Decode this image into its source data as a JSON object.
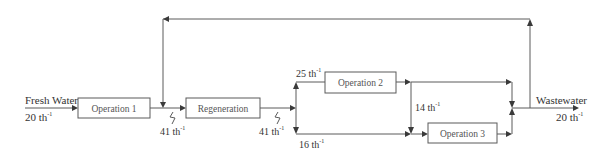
{
  "diagram": {
    "type": "water-network-flowsheet",
    "units": {
      "op1": {
        "label": "Operation 1"
      },
      "regen": {
        "label": "Regeneration"
      },
      "op2": {
        "label": "Operation 2"
      },
      "op3": {
        "label": "Operation 3"
      }
    },
    "streams": {
      "fresh_water": {
        "label": "Fresh Water",
        "flow": "20 th",
        "sup": "-1"
      },
      "op1_out": {
        "flow": "41 th",
        "sup": "-1"
      },
      "regen_out": {
        "flow": "41 th",
        "sup": "-1"
      },
      "to_op2": {
        "flow": "25 th",
        "sup": "-1"
      },
      "to_op3_direct": {
        "flow": "16 th",
        "sup": "-1"
      },
      "op2_to_op3": {
        "flow": "14 th",
        "sup": "-1"
      },
      "wastewater": {
        "label": "Wastewater",
        "flow": "20 th",
        "sup": "-1"
      }
    },
    "colors": {
      "line": "#5a5a5a",
      "arrow": "#3a3a3a",
      "text": "#333333"
    }
  }
}
